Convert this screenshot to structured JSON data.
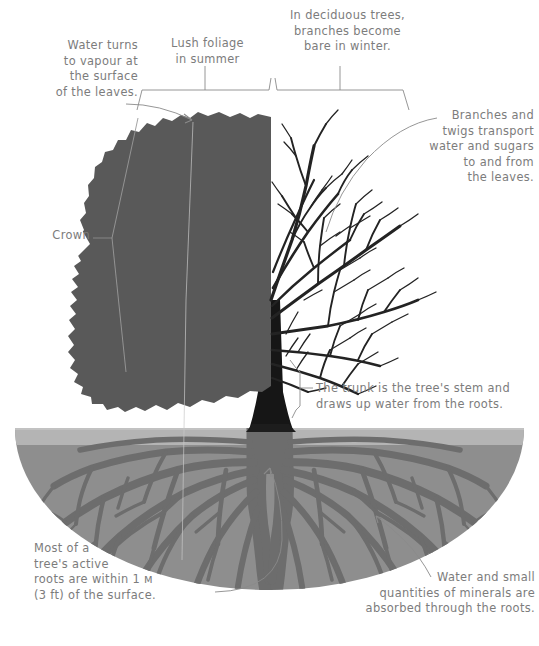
{
  "diagram": {
    "colors": {
      "background": "#ffffff",
      "text": "#7c7c7c",
      "leader_line": "#8a8a8a",
      "foliage": "#595959",
      "branches": "#232323",
      "trunk": "#161616",
      "topsoil": "#b4b4b4",
      "subsoil": "#8e8e8e",
      "roots": "#6d6d6d"
    }
  },
  "brackets": [
    {
      "id": "foliage-bracket",
      "label": "Lush foliage\nin summer",
      "span": "left half of crown"
    },
    {
      "id": "bare-bracket",
      "label": "In deciduous trees,\nbranches become\nbare in winter.",
      "span": "right half of crown"
    }
  ],
  "annotations": [
    {
      "id": "transpiration",
      "text": "Water turns\nto vapour at\nthe surface\nof the leaves.",
      "align": "right",
      "points_to": "leaf surface at top-left of crown"
    },
    {
      "id": "crown",
      "text": "Crown",
      "align": "right",
      "points_to": "outer edge of foliage mass"
    },
    {
      "id": "branches",
      "text": "Branches and\ntwigs transport\nwater and sugars\nto and from\nthe leaves.",
      "align": "right",
      "points_to": "bare branch network"
    },
    {
      "id": "trunk",
      "text": "The trunk is the tree's stem and\ndraws up water from the roots.",
      "align": "left",
      "points_to": "trunk"
    },
    {
      "id": "active-roots",
      "text_lines": [
        "Most of a",
        "tree's active",
        "roots are within 1 м",
        "(3 ft) of the surface."
      ],
      "text": "Most of a\ntree's active\nroots are within 1 м\n(3 ft) of the surface.",
      "align": "left",
      "points_to": "shallow lateral roots",
      "depth_metric": "1 m",
      "depth_imperial": "3 ft"
    },
    {
      "id": "absorption",
      "text": "Water and small\nquantities of minerals are\nabsorbed through the roots.",
      "align": "right",
      "points_to": "fine root tips"
    }
  ]
}
